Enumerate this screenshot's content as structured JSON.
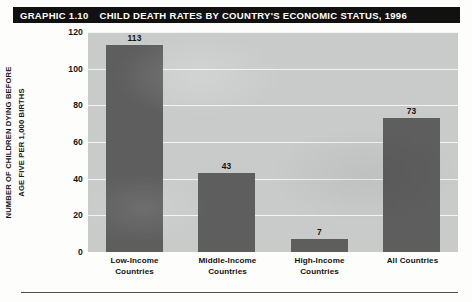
{
  "header": {
    "graphic_number": "GRAPHIC 1.10",
    "title": "CHILD DEATH RATES BY COUNTRY'S ECONOMIC STATUS, 1996"
  },
  "axis": {
    "ylabel_line1": "NUMBER OF CHILDREN DYING BEFORE",
    "ylabel_line2": "AGE FIVE PER 1,000 BIRTHS",
    "yticks": [
      "120",
      "100",
      "80",
      "60",
      "40",
      "20",
      "0"
    ]
  },
  "colors": {
    "bar": "#5d5e5d",
    "plot_background": "#c9cbca",
    "gridline": "#f2f3f2",
    "banner": "#111111",
    "banner_text": "#ffffff"
  },
  "chart_data": {
    "type": "bar",
    "title": "CHILD DEATH RATES BY COUNTRY'S ECONOMIC STATUS, 1996",
    "xlabel": "",
    "ylabel": "NUMBER OF CHILDREN DYING BEFORE AGE FIVE PER 1,000 BIRTHS",
    "ylim": [
      0,
      120
    ],
    "ytick_values": [
      0,
      20,
      40,
      60,
      80,
      100,
      120
    ],
    "grid": true,
    "legend": false,
    "categories": [
      "Low-Income Countries",
      "Middle-Income Countries",
      "High-Income Countries",
      "All Countries"
    ],
    "category_lines": [
      [
        "Low-Income",
        "Countries"
      ],
      [
        "Middle-Income",
        "Countries"
      ],
      [
        "High-Income",
        "Countries"
      ],
      [
        "All Countries",
        ""
      ]
    ],
    "values": [
      113,
      43,
      7,
      73
    ],
    "data_labels": [
      "113",
      "43",
      "7",
      "73"
    ]
  }
}
